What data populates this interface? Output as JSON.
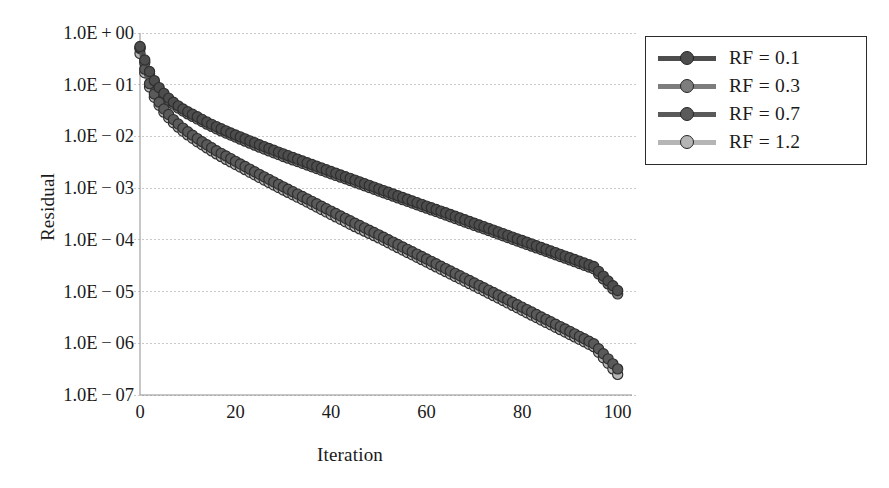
{
  "chart_data": {
    "type": "scatter",
    "title": "",
    "xlabel": "Iteration",
    "ylabel": "Residual",
    "yscale": "log",
    "xlim": [
      0,
      103
    ],
    "ylim": [
      1e-07,
      1.0
    ],
    "grid": true,
    "gridlines": "horizontal-dotted",
    "legend_position": "top-right",
    "xticks": [
      0,
      20,
      40,
      60,
      80,
      100
    ],
    "xtick_labels": [
      "0",
      "20",
      "40",
      "60",
      "80",
      "100"
    ],
    "yticks": [
      1,
      0.1,
      0.01,
      0.001,
      0.0001,
      1e-05,
      1e-06,
      1e-07
    ],
    "ytick_labels": [
      "1.0E+00",
      "1.0E-01",
      "1.0E-02",
      "1.0E-03",
      "1.0E-04",
      "1.0E-05",
      "1.0E-06",
      "1.0E-07"
    ],
    "series": [
      {
        "name": "RF = 0.1",
        "color": "#4d4d4d",
        "marker": "circle",
        "band": "upper",
        "start": 0.55,
        "end": 1.05e-05,
        "x": [
          0,
          1,
          2,
          3,
          4,
          5,
          6,
          7,
          8,
          9,
          10,
          12,
          14,
          16,
          18,
          20,
          25,
          30,
          35,
          40,
          45,
          50,
          55,
          60,
          65,
          70,
          75,
          80,
          85,
          90,
          95,
          100
        ],
        "y": [
          0.55,
          0.3,
          0.18,
          0.12,
          0.088,
          0.068,
          0.055,
          0.046,
          0.039,
          0.034,
          0.03,
          0.024,
          0.019,
          0.0155,
          0.0128,
          0.0107,
          0.0069,
          0.0046,
          0.0031,
          0.0021,
          0.00143,
          0.00097,
          0.00066,
          0.00045,
          0.00031,
          0.00021,
          0.000143,
          9.7e-05,
          6.6e-05,
          4.5e-05,
          3.05e-05,
          1.05e-05
        ]
      },
      {
        "name": "RF = 0.3",
        "color": "#7d7d7d",
        "marker": "circle",
        "band": "upper",
        "start": 0.5,
        "end": 9e-06,
        "x": [
          0,
          1,
          2,
          3,
          4,
          5,
          6,
          7,
          8,
          9,
          10,
          12,
          14,
          16,
          18,
          20,
          25,
          30,
          35,
          40,
          45,
          50,
          55,
          60,
          65,
          70,
          75,
          80,
          85,
          90,
          95,
          100
        ],
        "y": [
          0.5,
          0.27,
          0.163,
          0.109,
          0.08,
          0.062,
          0.05,
          0.042,
          0.0355,
          0.031,
          0.0273,
          0.0218,
          0.0173,
          0.0141,
          0.0116,
          0.0097,
          0.0062,
          0.0041,
          0.0028,
          0.0019,
          0.0013,
          0.00088,
          0.0006,
          0.00041,
          0.00028,
          0.00019,
          0.00013,
          8.8e-05,
          6e-05,
          4.1e-05,
          2.75e-05,
          9e-06
        ]
      },
      {
        "name": "RF = 0.7",
        "color": "#5a5a5a",
        "marker": "circle",
        "band": "lower",
        "start": 0.52,
        "end": 3.2e-07,
        "x": [
          0,
          1,
          2,
          3,
          4,
          5,
          6,
          7,
          8,
          9,
          10,
          12,
          14,
          16,
          18,
          20,
          25,
          30,
          35,
          40,
          45,
          50,
          55,
          60,
          65,
          70,
          75,
          80,
          85,
          90,
          95,
          100
        ],
        "y": [
          0.52,
          0.2,
          0.105,
          0.066,
          0.046,
          0.034,
          0.0265,
          0.0212,
          0.0174,
          0.0145,
          0.0123,
          0.0091,
          0.0069,
          0.0053,
          0.0042,
          0.0033,
          0.00185,
          0.00106,
          0.00062,
          0.00036,
          0.00021,
          0.000125,
          7.3e-05,
          4.28e-05,
          2.5e-05,
          1.47e-05,
          8.6e-06,
          5e-06,
          2.9e-06,
          1.7e-06,
          9.8e-07,
          3.2e-07
        ]
      },
      {
        "name": "RF = 1.2",
        "color": "#b5b5b5",
        "marker": "circle",
        "band": "lower",
        "start": 0.4,
        "end": 2.5e-07,
        "x": [
          0,
          1,
          2,
          3,
          4,
          5,
          6,
          7,
          8,
          9,
          10,
          12,
          14,
          16,
          18,
          20,
          25,
          30,
          35,
          40,
          45,
          50,
          55,
          60,
          65,
          70,
          75,
          80,
          85,
          90,
          95,
          100
        ],
        "y": [
          0.4,
          0.17,
          0.09,
          0.057,
          0.04,
          0.0295,
          0.023,
          0.0184,
          0.0151,
          0.0126,
          0.0107,
          0.0079,
          0.006,
          0.0046,
          0.0036,
          0.00287,
          0.00161,
          0.00092,
          0.00054,
          0.00031,
          0.00018,
          0.000109,
          6.35e-05,
          3.72e-05,
          2.18e-05,
          1.28e-05,
          7.5e-06,
          4.35e-06,
          2.53e-06,
          1.48e-06,
          8.6e-07,
          2.5e-07
        ]
      }
    ]
  },
  "legend": {
    "entries": [
      {
        "label": "RF = 0.1"
      },
      {
        "label": "RF = 0.3"
      },
      {
        "label": "RF = 0.7"
      },
      {
        "label": "RF = 1.2"
      }
    ]
  }
}
